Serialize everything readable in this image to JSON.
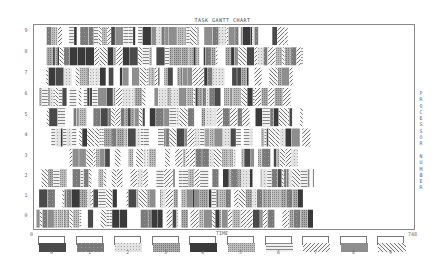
{
  "chart_data": {
    "type": "gantt",
    "title": "TASK GANTT CHART",
    "xlabel": "TIME",
    "ylabel": "PROCESSOR NUMBER",
    "x_ticks": [
      "0",
      "748"
    ],
    "xlim": [
      0,
      748
    ],
    "processors": [
      "9",
      "8",
      "7",
      "6",
      "5",
      "4",
      "3",
      "2",
      "1",
      "0"
    ],
    "legend": [
      "0",
      "1",
      "2",
      "3",
      "4",
      "5",
      "6",
      "7",
      "8",
      "9"
    ],
    "processor_end_times": {
      "9": 500,
      "8": 530,
      "7": 510,
      "6": 510,
      "5": 530,
      "4": 550,
      "3": 520,
      "2": 550,
      "1": 530,
      "0": 550
    },
    "processor_start_times": {
      "9": 25,
      "8": 25,
      "7": 15,
      "6": 10,
      "5": 25,
      "4": 20,
      "3": 70,
      "2": 15,
      "1": 10,
      "0": 5
    },
    "grid": false,
    "legend_position": "bottom"
  },
  "title": "TASK GANTT CHART",
  "xlabel": "TIME",
  "ylabel_vertical": "P\nR\nO\nC\nE\nS\nS\nO\nR\n\nN\nU\nM\nB\nE\nR",
  "x_start": "0",
  "x_end": "748"
}
